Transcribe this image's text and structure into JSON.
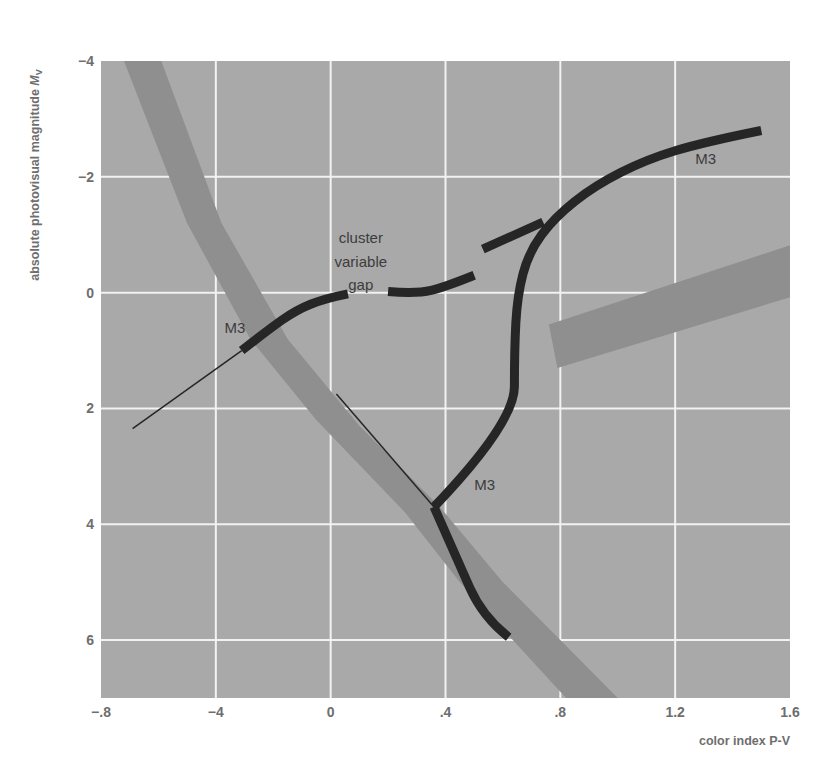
{
  "chart_data": {
    "type": "line",
    "title": "",
    "xlabel": "color index P-V",
    "ylabel": "absolute photovisual magnitude Mv",
    "ylabel_main": "absolute photovisual magnitude ",
    "ylabel_italic": "M",
    "ylabel_sub": "V",
    "xlim": [
      -0.8,
      1.6
    ],
    "ylim": [
      7,
      -4
    ],
    "y_inverted": true,
    "grid": true,
    "x_ticks": [
      -0.8,
      -0.4,
      0,
      0.4,
      0.8,
      1.2,
      1.6
    ],
    "x_tick_labels": [
      "−.8",
      "−4",
      "0",
      ".4",
      ".8",
      "1.2",
      "1.6"
    ],
    "y_ticks": [
      -4,
      -2,
      0,
      2,
      4,
      6
    ],
    "y_tick_labels": [
      "−4",
      "−2",
      "0",
      "2",
      "4",
      "6"
    ],
    "colors": {
      "plot_background": "#a9a9a9",
      "grid": "#f2f2f2",
      "band": "#8f8f8f",
      "cluster_sequence": "#262626",
      "tick_text": "#6e6e6e",
      "annotation_text": "#3c3c3c"
    },
    "bands": [
      {
        "name": "zero-age main sequence band (upper)",
        "polygon": [
          [
            -0.72,
            -4.0
          ],
          [
            -0.59,
            -4.0
          ],
          [
            -0.38,
            -1.2
          ],
          [
            -0.15,
            0.8
          ],
          [
            0.1,
            2.3
          ],
          [
            0.38,
            3.7
          ],
          [
            0.6,
            5.0
          ],
          [
            1.0,
            7.0
          ],
          [
            0.82,
            7.0
          ],
          [
            0.45,
            5.0
          ],
          [
            0.26,
            3.8
          ],
          [
            -0.05,
            2.2
          ],
          [
            -0.28,
            0.8
          ],
          [
            -0.5,
            -1.2
          ]
        ]
      },
      {
        "name": "giant band (right)",
        "polygon": [
          [
            0.76,
            0.55
          ],
          [
            1.62,
            -0.85
          ],
          [
            1.62,
            0.05
          ],
          [
            0.79,
            1.3
          ]
        ]
      }
    ],
    "series": [
      {
        "name": "M3 main sequence (thick)",
        "label": "M3",
        "width": 9,
        "points": [
          [
            0.36,
            3.7
          ],
          [
            0.44,
            4.6
          ],
          [
            0.53,
            5.6
          ],
          [
            0.62,
            5.95
          ]
        ]
      },
      {
        "name": "M3 main sequence extension (thin)",
        "width": 1.5,
        "points": [
          [
            0.02,
            1.75
          ],
          [
            0.36,
            3.7
          ]
        ]
      },
      {
        "name": "M3 subgiant branch",
        "width": 9,
        "points": [
          [
            0.36,
            3.7
          ],
          [
            0.64,
            2.25
          ],
          [
            0.64,
            1.0
          ],
          [
            0.65,
            0.05
          ],
          [
            0.69,
            -0.7
          ],
          [
            0.78,
            -1.3
          ],
          [
            0.92,
            -1.85
          ],
          [
            1.1,
            -2.3
          ],
          [
            1.3,
            -2.6
          ],
          [
            1.5,
            -2.8
          ]
        ]
      },
      {
        "name": "M3 horizontal branch (blue side, thick)",
        "width": 9,
        "points": [
          [
            -0.31,
            1.0
          ],
          [
            -0.22,
            0.65
          ],
          [
            -0.12,
            0.3
          ],
          [
            -0.02,
            0.1
          ],
          [
            0.06,
            0.02
          ]
        ]
      },
      {
        "name": "M3 horizontal branch (thin extension)",
        "width": 1.5,
        "points": [
          [
            -0.69,
            2.35
          ],
          [
            -0.31,
            1.0
          ]
        ]
      },
      {
        "name": "M3 horizontal branch (red side dash 1)",
        "width": 9,
        "points": [
          [
            0.2,
            -0.02
          ],
          [
            0.3,
            0.02
          ],
          [
            0.4,
            -0.1
          ],
          [
            0.5,
            -0.3
          ]
        ]
      },
      {
        "name": "M3 horizontal branch (red side dash 2)",
        "width": 9,
        "points": [
          [
            0.53,
            -0.75
          ],
          [
            0.74,
            -1.22
          ]
        ]
      }
    ],
    "annotations": [
      {
        "text": "M3",
        "x": -0.37,
        "y": 0.7
      },
      {
        "text": "M3",
        "x": 1.27,
        "y": -2.22
      },
      {
        "text": "M3",
        "x": 0.5,
        "y": 3.4
      },
      {
        "text": "cluster",
        "x": 0.105,
        "y": -0.85
      },
      {
        "text": "variable",
        "x": 0.105,
        "y": -0.45
      },
      {
        "text": "gap",
        "x": 0.105,
        "y": -0.05
      }
    ]
  }
}
